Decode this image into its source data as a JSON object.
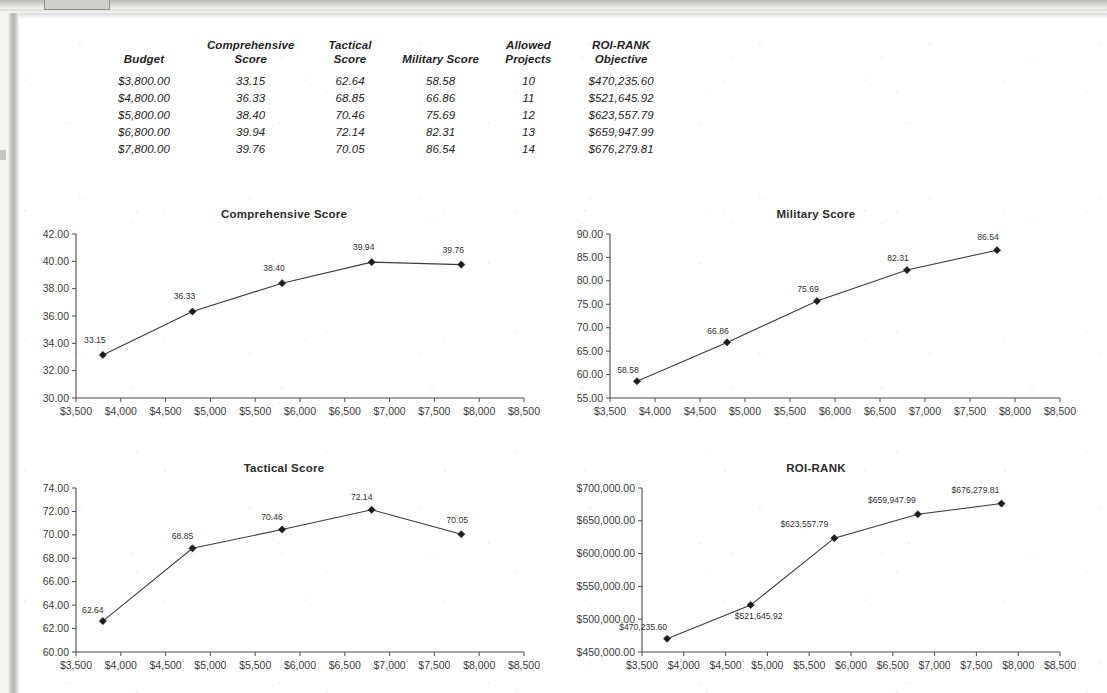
{
  "document": {
    "type": "scanned-report-page"
  },
  "table": {
    "headers": [
      "Budget",
      "Comprehensive Score",
      "Tactical Score",
      "Military Score",
      "Allowed Projects",
      "ROI-RANK Objective"
    ],
    "headers_wrapped": [
      [
        "Budget"
      ],
      [
        "Comprehensive",
        "Score"
      ],
      [
        "Tactical",
        "Score"
      ],
      [
        "Military Score"
      ],
      [
        "Allowed",
        "Projects"
      ],
      [
        "ROI-RANK",
        "Objective"
      ]
    ],
    "rows": [
      [
        "$3,800.00",
        "33.15",
        "62.64",
        "58.58",
        "10",
        "$470,235.60"
      ],
      [
        "$4,800.00",
        "36.33",
        "68.85",
        "66.86",
        "11",
        "$521,645.92"
      ],
      [
        "$5,800.00",
        "38.40",
        "70.46",
        "75.69",
        "12",
        "$623,557.79"
      ],
      [
        "$6,800.00",
        "39.94",
        "72.14",
        "82.31",
        "13",
        "$659,947.99"
      ],
      [
        "$7,800.00",
        "39.76",
        "70.05",
        "86.54",
        "14",
        "$676,279.81"
      ]
    ]
  },
  "chart_data": [
    {
      "id": "comprehensive-score",
      "type": "line",
      "title": "Comprehensive Score",
      "xlabel": "",
      "ylabel": "",
      "x": [
        3800,
        4800,
        5800,
        6800,
        7800
      ],
      "values": [
        33.15,
        36.33,
        38.4,
        39.94,
        39.76
      ],
      "point_labels": [
        "33.15",
        "36.33",
        "38.40",
        "39.94",
        "39.76"
      ],
      "xlim": [
        3500,
        8500
      ],
      "ylim": [
        30,
        42
      ],
      "ytick_values": [
        30,
        32,
        34,
        36,
        38,
        40,
        42
      ],
      "ytick_labels": [
        "30.00",
        "32.00",
        "34.00",
        "36.00",
        "38.00",
        "40.00",
        "42.00"
      ],
      "xtick_values": [
        3500,
        4000,
        4500,
        5000,
        5500,
        6000,
        6500,
        7000,
        7500,
        8000,
        8500
      ],
      "xtick_labels": [
        "$3,500",
        "$4,000",
        "$4,500",
        "$5,000",
        "$5,500",
        "$6,000",
        "$6,500",
        "$7,000",
        "$7,500",
        "$8,000",
        "$8,500"
      ],
      "label_offsets": [
        [
          -8,
          -12
        ],
        [
          -8,
          -12
        ],
        [
          -8,
          -12
        ],
        [
          -8,
          -12
        ],
        [
          -8,
          -12
        ]
      ],
      "grid": false,
      "legend": false,
      "marker": "diamond",
      "color": "#2b2b2b"
    },
    {
      "id": "military-score",
      "type": "line",
      "title": "Military Score",
      "xlabel": "",
      "ylabel": "",
      "x": [
        3800,
        4800,
        5800,
        6800,
        7800
      ],
      "values": [
        58.58,
        66.86,
        75.69,
        82.31,
        86.54
      ],
      "point_labels": [
        "58.58",
        "66.86",
        "75.69",
        "82.31",
        "86.54"
      ],
      "xlim": [
        3500,
        8500
      ],
      "ylim": [
        55,
        90
      ],
      "ytick_values": [
        55,
        60,
        65,
        70,
        75,
        80,
        85,
        90
      ],
      "ytick_labels": [
        "55.00",
        "60.00",
        "65.00",
        "70.00",
        "75.00",
        "80.00",
        "85.00",
        "90.00"
      ],
      "xtick_values": [
        3500,
        4000,
        4500,
        5000,
        5500,
        6000,
        6500,
        7000,
        7500,
        8000,
        8500
      ],
      "xtick_labels": [
        "$3,500",
        "$4,000",
        "$4,500",
        "$5,000",
        "$5,500",
        "$6,000",
        "$6,500",
        "$7,000",
        "$7,500",
        "$8,000",
        "$8,500"
      ],
      "label_offsets": [
        [
          -9,
          -8
        ],
        [
          -9,
          -8
        ],
        [
          -9,
          -9
        ],
        [
          -9,
          -9
        ],
        [
          -9,
          -10
        ]
      ],
      "grid": false,
      "legend": false,
      "marker": "diamond",
      "color": "#2b2b2b"
    },
    {
      "id": "tactical-score",
      "type": "line",
      "title": "Tactical Score",
      "xlabel": "",
      "ylabel": "",
      "x": [
        3800,
        4800,
        5800,
        6800,
        7800
      ],
      "values": [
        62.64,
        68.85,
        70.46,
        72.14,
        70.05
      ],
      "point_labels": [
        "62.64",
        "68.85",
        "70.46",
        "72.14",
        "70.05"
      ],
      "xlim": [
        3500,
        8500
      ],
      "ylim": [
        60,
        74
      ],
      "ytick_values": [
        60,
        62,
        64,
        66,
        68,
        70,
        72,
        74
      ],
      "ytick_labels": [
        "60.00",
        "62.00",
        "64.00",
        "66.00",
        "68.00",
        "70.00",
        "72.00",
        "74.00"
      ],
      "xtick_values": [
        3500,
        4000,
        4500,
        5000,
        5500,
        6000,
        6500,
        7000,
        7500,
        8000,
        8500
      ],
      "xtick_labels": [
        "$3,500",
        "$4,000",
        "$4,500",
        "$5,000",
        "$5,500",
        "$6,000",
        "$6,500",
        "$7,000",
        "$7,500",
        "$8,000",
        "$8,500"
      ],
      "label_offsets": [
        [
          -10,
          -8
        ],
        [
          -10,
          -9
        ],
        [
          -10,
          -9
        ],
        [
          -10,
          -10
        ],
        [
          -4,
          -11
        ]
      ],
      "grid": false,
      "legend": false,
      "marker": "diamond",
      "color": "#2b2b2b"
    },
    {
      "id": "roi-rank",
      "type": "line",
      "title": "ROI-RANK",
      "xlabel": "",
      "ylabel": "",
      "x": [
        3800,
        4800,
        5800,
        6800,
        7800
      ],
      "values": [
        470235.6,
        521645.92,
        623557.79,
        659947.99,
        676279.81
      ],
      "point_labels": [
        "$470,235.60",
        "$521,645.92",
        "$623,557.79",
        "$659,947.99",
        "$676,279.81"
      ],
      "xlim": [
        3500,
        8500
      ],
      "ylim": [
        450000,
        700000
      ],
      "ytick_values": [
        450000,
        500000,
        550000,
        600000,
        650000,
        700000
      ],
      "ytick_labels": [
        "$450,000.00",
        "$500,000.00",
        "$550,000.00",
        "$600,000.00",
        "$650,000.00",
        "$700,000.00"
      ],
      "xtick_values": [
        3500,
        4000,
        4500,
        5000,
        5500,
        6000,
        6500,
        7000,
        7500,
        8000,
        8500
      ],
      "xtick_labels": [
        "$3,500",
        "$4,000",
        "$4,500",
        "$5,000",
        "$5,500",
        "$6,000",
        "$6,500",
        "$7,000",
        "$7,500",
        "$8,000",
        "$8,500"
      ],
      "label_offsets": [
        [
          -24,
          -9
        ],
        [
          8,
          14
        ],
        [
          -30,
          -11
        ],
        [
          -26,
          -11
        ],
        [
          -26,
          -11
        ]
      ],
      "grid": false,
      "legend": false,
      "marker": "diamond",
      "color": "#2b2b2b"
    }
  ],
  "colors": {
    "line": "#2b2b2b",
    "marker": "#1d1d1d",
    "axis": "#4a4a4a",
    "text": "#2a2a2a",
    "paper": "#ffffff",
    "scan_border": "#b4b4b1"
  }
}
